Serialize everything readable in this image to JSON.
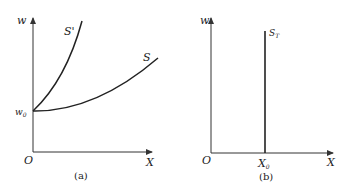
{
  "panels": [
    {
      "id": "a",
      "caption": "(a)",
      "y_axis_label": "w",
      "x_axis_label": "X",
      "origin_label": "O",
      "intercept_label": "w",
      "intercept_sub": "0",
      "curves": [
        {
          "name": "S'",
          "label": "S'",
          "description": "steep convex curve rising from w0"
        },
        {
          "name": "S",
          "label": "S",
          "description": "shallow convex curve rising from w0"
        }
      ]
    },
    {
      "id": "b",
      "caption": "(b)",
      "y_axis_label": "w",
      "x_axis_label": "X",
      "origin_label": "O",
      "x_mark_label": "X",
      "x_mark_sub": "0",
      "curves": [
        {
          "name": "S_T",
          "label": "S",
          "label_sub": "T",
          "description": "vertical line at X0"
        }
      ]
    }
  ],
  "colors": {
    "line": "#222222",
    "axis": "#333333",
    "background": "#ffffff"
  }
}
